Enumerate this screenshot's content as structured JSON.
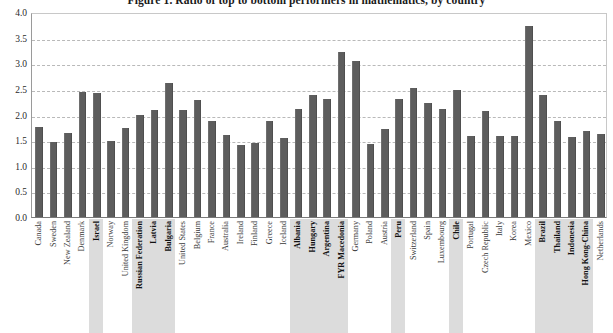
{
  "chart_data": {
    "type": "bar",
    "title": "Figure 1. Ratio of top to bottom performers in mathematics, by country",
    "xlabel": "",
    "ylabel": "",
    "ylim": [
      0.0,
      4.0
    ],
    "ytick_step": 0.5,
    "ytick_labels": [
      "0.0",
      "0.5",
      "1.0",
      "1.5",
      "2.0",
      "2.5",
      "3.0",
      "3.5",
      "4.0"
    ],
    "ytick_values": [
      0.0,
      0.5,
      1.0,
      1.5,
      2.0,
      2.5,
      3.0,
      3.5,
      4.0
    ],
    "grid": true,
    "legend": "none",
    "bar_color": "#5d5d5d",
    "highlight_color": "#dcdcdc",
    "categories": [
      "Canada",
      "Sweden",
      "New Zealand",
      "Denmark",
      "Israel",
      "Norway",
      "United Kingdom",
      "Russian Federation",
      "Latvia",
      "Bulgaria",
      "United States",
      "Belgium",
      "France",
      "Australia",
      "Ireland",
      "Finland",
      "Greece",
      "Iceland",
      "Albania",
      "Hungary",
      "Argentina",
      "FYR Macedonia",
      "Germany",
      "Poland",
      "Austria",
      "Peru",
      "Switzerland",
      "Spain",
      "Luxembourg",
      "Chile",
      "Portugal",
      "Czech Republic",
      "Italy",
      "Korea",
      "Mexico",
      "Brazil",
      "Thailand",
      "Indonesia",
      "Hong Kong-China",
      "Netherlands"
    ],
    "values": [
      1.76,
      1.46,
      1.63,
      2.44,
      2.42,
      1.48,
      1.74,
      2.0,
      2.08,
      2.61,
      2.09,
      2.29,
      1.87,
      1.6,
      1.4,
      1.44,
      1.88,
      1.54,
      2.11,
      2.38,
      2.31,
      3.22,
      3.05,
      1.43,
      1.71,
      2.3,
      2.52,
      2.22,
      2.11,
      2.48,
      1.59,
      2.07,
      1.59,
      1.59,
      3.72,
      2.38,
      1.87,
      1.56,
      1.67,
      1.62
    ],
    "bold_categories": [
      "Israel",
      "Russian Federation",
      "Latvia",
      "Bulgaria",
      "Albania",
      "Hungary",
      "Argentina",
      "FYR Macedonia",
      "Peru",
      "Chile",
      "Brazil",
      "Thailand",
      "Indonesia",
      "Hong Kong-China"
    ]
  }
}
